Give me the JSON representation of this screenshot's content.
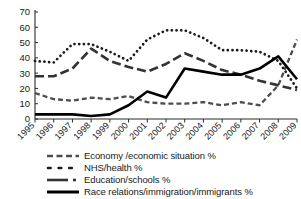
{
  "chart_data": {
    "type": "line",
    "title": "",
    "xlabel": "",
    "ylabel": "",
    "ylim": [
      0,
      70
    ],
    "yticks": [
      0,
      10,
      20,
      30,
      40,
      50,
      60,
      70
    ],
    "grid": false,
    "legend_position": "bottom",
    "categories": [
      "1995",
      "1996",
      "1997",
      "1998",
      "1999",
      "2000",
      "2001",
      "2002",
      "2003",
      "2004",
      "2005",
      "2006",
      "2007",
      "2008",
      "2009"
    ],
    "series": [
      {
        "name": "Economy /economic situation %",
        "style": "short-dash",
        "color": "#4d4d4d",
        "values": [
          17,
          13,
          12,
          14,
          13,
          15,
          11,
          10,
          10,
          11,
          9,
          11,
          9,
          22,
          52
        ]
      },
      {
        "name": "NHS/health %",
        "style": "dotted",
        "color": "#1a1a1a",
        "values": [
          38,
          37,
          49,
          49,
          44,
          38,
          52,
          58,
          58,
          53,
          45,
          45,
          44,
          38,
          20
        ]
      },
      {
        "name": "Education/schools %",
        "style": "long-dash",
        "color": "#333333",
        "values": [
          28,
          28,
          33,
          46,
          38,
          34,
          31,
          36,
          43,
          38,
          32,
          29,
          25,
          22,
          19
        ]
      },
      {
        "name": "Race relations/immigration/immigrants %",
        "style": "solid",
        "color": "#000000",
        "values": [
          3,
          3,
          3,
          2,
          3,
          9,
          18,
          14,
          33,
          31,
          29,
          29,
          33,
          41,
          26
        ]
      }
    ]
  },
  "legend": {
    "items": [
      {
        "label": "Economy /economic situation %",
        "swatch": "short-dash-swatch"
      },
      {
        "label": "NHS/health %",
        "swatch": "dotted-swatch"
      },
      {
        "label": "Education/schools %",
        "swatch": "long-dash-swatch"
      },
      {
        "label": "Race relations/immigration/immigrants %",
        "swatch": "solid-swatch"
      }
    ]
  }
}
